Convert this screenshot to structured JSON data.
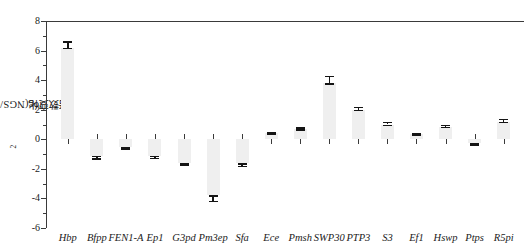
{
  "chart_data": {
    "type": "bar",
    "title": "",
    "xlabel": "",
    "ylabel": "log2倍数变化(NGS/GS)",
    "ylabel_parts": {
      "prefix": "log",
      "sub": "2",
      "suffix": "倍数变化(NGS/GS)"
    },
    "ylim": [
      -6,
      8
    ],
    "ytick_labels": [
      "8",
      "6",
      "4",
      "2",
      "0",
      "-2",
      "-4",
      "-6"
    ],
    "ytick_values": [
      8,
      6,
      4,
      2,
      0,
      -2,
      -4,
      -6
    ],
    "ytick_minor_values": [
      7,
      5,
      3,
      1,
      -1,
      -3,
      -5
    ],
    "grid": false,
    "legend": "none",
    "error_bars": true,
    "categories": [
      "Hbp",
      "Bfpp",
      "FEN1-A",
      "Ep1",
      "G3pd",
      "Pm3ep",
      "Sfa",
      "Ece",
      "Pmsh",
      "SWP30",
      "PTP3",
      "S3",
      "Ef1",
      "Hswp",
      "Ptps",
      "R5pi"
    ],
    "values": [
      6.2,
      -1.1,
      -0.5,
      -1.1,
      -1.6,
      -3.8,
      -1.6,
      0.4,
      0.7,
      3.8,
      2.0,
      1.0,
      0.35,
      0.85,
      -0.25,
      1.2
    ],
    "errors": [
      0.45,
      0.18,
      0.1,
      0.15,
      0.12,
      0.35,
      0.2,
      0.1,
      0.1,
      0.5,
      0.2,
      0.2,
      0.08,
      0.15,
      0.12,
      0.18
    ],
    "series": [
      {
        "name": "log2 fold change (NGS/GS)",
        "points": [
          {
            "category": "Hbp",
            "value": 6.2,
            "error": 0.45
          },
          {
            "category": "Bfpp",
            "value": -1.1,
            "error": 0.18
          },
          {
            "category": "FEN1-A",
            "value": -0.5,
            "error": 0.1
          },
          {
            "category": "Ep1",
            "value": -1.1,
            "error": 0.15
          },
          {
            "category": "G3pd",
            "value": -1.6,
            "error": 0.12
          },
          {
            "category": "Pm3ep",
            "value": -3.8,
            "error": 0.35
          },
          {
            "category": "Sfa",
            "value": -1.6,
            "error": 0.2
          },
          {
            "category": "Ece",
            "value": 0.4,
            "error": 0.1
          },
          {
            "category": "Pmsh",
            "value": 0.7,
            "error": 0.1
          },
          {
            "category": "SWP30",
            "value": 3.8,
            "error": 0.5
          },
          {
            "category": "PTP3",
            "value": 2.0,
            "error": 0.2
          },
          {
            "category": "S3",
            "value": 1.0,
            "error": 0.2
          },
          {
            "category": "Ef1",
            "value": 0.35,
            "error": 0.08
          },
          {
            "category": "Hswp",
            "value": 0.85,
            "error": 0.15
          },
          {
            "category": "Ptps",
            "value": -0.25,
            "error": 0.12
          },
          {
            "category": "R5pi",
            "value": 1.2,
            "error": 0.18
          }
        ]
      }
    ],
    "colors": {
      "bar_fill": "#efefef",
      "axis": "#3a3a3a",
      "error_bar": "#141414",
      "background": "#ffffff"
    }
  }
}
